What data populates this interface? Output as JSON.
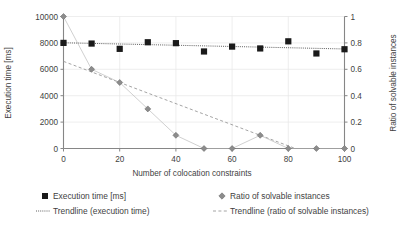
{
  "chart_data": {
    "type": "scatter",
    "title": "",
    "xlabel": "Number of colocation constraints",
    "ylabel": "Execution time [ms]",
    "y2label": "Ratio of solvable instances",
    "xlim": [
      0,
      100
    ],
    "ylim": [
      0,
      10000
    ],
    "y2lim": [
      0,
      1
    ],
    "grid": true,
    "legend_position": "bottom",
    "x": [
      0,
      10,
      20,
      30,
      40,
      50,
      60,
      70,
      80,
      90,
      100
    ],
    "xticks": [
      "0",
      "20",
      "40",
      "60",
      "80",
      "100"
    ],
    "xtick_values": [
      0,
      20,
      40,
      60,
      80,
      100
    ],
    "yticks": [
      "0",
      "2000",
      "4000",
      "6000",
      "8000",
      "10000"
    ],
    "ytick_values": [
      0,
      2000,
      4000,
      6000,
      8000,
      10000
    ],
    "y2ticks": [
      "0",
      "0.2",
      "0.4",
      "0.6",
      "0.8",
      "1"
    ],
    "y2tick_values": [
      0,
      0.2,
      0.4,
      0.6,
      0.8,
      1
    ],
    "series": [
      {
        "name": "Execution time [ms]",
        "marker": "square",
        "axis": "left",
        "color": "#1a1a1a",
        "values": [
          8000,
          7950,
          7550,
          8050,
          7980,
          7350,
          7720,
          7580,
          8120,
          7200,
          7520
        ]
      },
      {
        "name": "Ratio of solvable instances",
        "marker": "diamond",
        "axis": "right",
        "color": "#8c8c8c",
        "values": [
          1.0,
          0.6,
          0.5,
          0.3,
          0.1,
          0.0,
          0.0,
          0.1,
          0.0,
          0.0,
          0.0
        ]
      }
    ],
    "trendlines": [
      {
        "name": "Trendline (execution time)",
        "axis": "left",
        "style": "dotted",
        "color": "#4d4d4d",
        "x0": 0,
        "y0": 8010,
        "x1": 100,
        "y1": 7540
      },
      {
        "name": "Trendline (ratio of solvable instances)",
        "axis": "right",
        "style": "dashed",
        "color": "#9a9a9a",
        "x0": 0,
        "y0": 0.66,
        "x1": 100,
        "y1": -0.14
      }
    ]
  },
  "legend": {
    "items": [
      {
        "label": "Execution time [ms]",
        "marker": "square"
      },
      {
        "label": "Ratio of solvable instances",
        "marker": "diamond"
      },
      {
        "label": "Trendline (execution time)",
        "marker": "dotted-line"
      },
      {
        "label": "Trendline (ratio of solvable instances)",
        "marker": "dashed-line"
      }
    ]
  }
}
